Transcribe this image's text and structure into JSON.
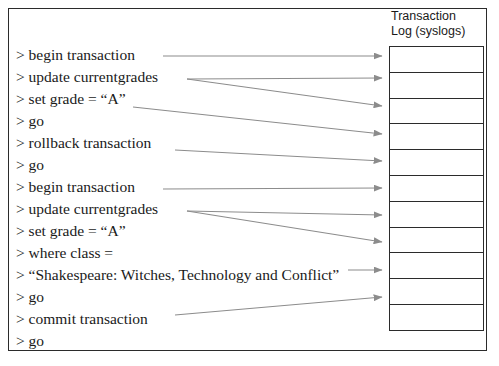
{
  "diagram": {
    "title_hidden": "",
    "commands": [
      {
        "text": "> begin transaction"
      },
      {
        "text": "> update currentgrades"
      },
      {
        "text": "> set grade = “A”"
      },
      {
        "text": "> go"
      },
      {
        "text": "> rollback transaction"
      },
      {
        "text": "> go"
      },
      {
        "text": "> begin transaction"
      },
      {
        "text": "> update currentgrades"
      },
      {
        "text": "> set grade = “A”"
      },
      {
        "text": "> where class ="
      },
      {
        "text": "> “Shakespeare: Witches, Technology and Conflict”"
      },
      {
        "text": "> go"
      },
      {
        "text": "> commit transaction"
      },
      {
        "text": "> go"
      }
    ],
    "log": {
      "header_line1": "Transaction",
      "header_line2": "Log (syslogs)",
      "entries": [
        {
          "text": ""
        },
        {
          "text": ""
        },
        {
          "text": ""
        },
        {
          "text": ""
        },
        {
          "text": ""
        },
        {
          "text": ""
        },
        {
          "text": ""
        },
        {
          "text": ""
        },
        {
          "text": ""
        },
        {
          "text": ""
        },
        {
          "text": ""
        }
      ]
    },
    "arrows": [
      {
        "name": "arrow-begin-transaction-1",
        "x1": 163,
        "y1": 56,
        "x2": 382,
        "y2": 56
      },
      {
        "name": "arrow-update-currentgrades-1",
        "x1": 187,
        "y1": 79,
        "x2": 382,
        "y2": 78
      },
      {
        "name": "arrow-update-to-box3-1",
        "x1": 187,
        "y1": 79,
        "x2": 382,
        "y2": 106
      },
      {
        "name": "arrow-set-grade-1",
        "x1": 133,
        "y1": 107,
        "x2": 382,
        "y2": 134
      },
      {
        "name": "arrow-rollback-transaction",
        "x1": 175,
        "y1": 150,
        "x2": 382,
        "y2": 161
      },
      {
        "name": "arrow-begin-transaction-2",
        "x1": 163,
        "y1": 189,
        "x2": 382,
        "y2": 188
      },
      {
        "name": "arrow-update-currentgrades-2",
        "x1": 187,
        "y1": 211,
        "x2": 382,
        "y2": 215
      },
      {
        "name": "arrow-update-to-box8-2",
        "x1": 187,
        "y1": 211,
        "x2": 382,
        "y2": 242
      },
      {
        "name": "arrow-shakespeare-line",
        "x1": 348,
        "y1": 270,
        "x2": 382,
        "y2": 270
      },
      {
        "name": "arrow-commit-transaction",
        "x1": 175,
        "y1": 315,
        "x2": 382,
        "y2": 297
      }
    ],
    "colors": {
      "arrow": "#8c8c8c",
      "border": "#2b2b2b",
      "text": "#1a1a1a",
      "background": "#ffffff"
    }
  }
}
